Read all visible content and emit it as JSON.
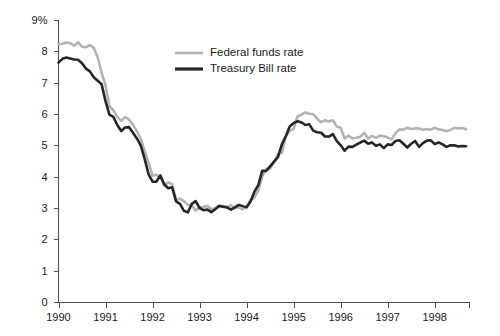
{
  "chart_data": {
    "type": "line",
    "title": "",
    "xlabel": "",
    "ylabel": "",
    "ylim": [
      0,
      9
    ],
    "xlim": [
      1990.0,
      1998.75
    ],
    "grid": false,
    "legend_position": "top-center",
    "y_ticks": [
      0,
      1,
      2,
      3,
      4,
      5,
      6,
      7,
      8,
      9
    ],
    "y_tick_labels": [
      "0",
      "1",
      "2",
      "3",
      "4",
      "5",
      "6",
      "7",
      "8",
      "9%"
    ],
    "x_ticks": [
      1990,
      1991,
      1992,
      1993,
      1994,
      1995,
      1996,
      1997,
      1998
    ],
    "x_tick_labels": [
      "1990",
      "1991",
      "1992",
      "1993",
      "1994",
      "1995",
      "1996",
      "1997",
      "1998"
    ],
    "colors": {
      "federal_funds": "#b3b3b3",
      "treasury_bill": "#262626",
      "axis": "#4d4d4d",
      "text": "#1a1a1a",
      "background": "#ffffff"
    },
    "x_start": 1990.0,
    "x_step": 0.08333,
    "series": [
      {
        "name": "Federal funds rate",
        "color_key": "federal_funds",
        "width": 2.6,
        "values": [
          8.23,
          8.24,
          8.28,
          8.26,
          8.18,
          8.29,
          8.15,
          8.13,
          8.2,
          8.11,
          7.81,
          7.31,
          6.91,
          6.25,
          6.12,
          5.91,
          5.78,
          5.9,
          5.82,
          5.66,
          5.45,
          5.21,
          4.81,
          4.43,
          4.03,
          4.06,
          3.98,
          3.73,
          3.82,
          3.76,
          3.25,
          3.3,
          3.22,
          3.1,
          3.09,
          2.92,
          3.02,
          3.03,
          3.07,
          2.96,
          3.0,
          3.04,
          3.06,
          3.03,
          3.09,
          2.99,
          3.02,
          2.96,
          3.05,
          3.25,
          3.34,
          3.56,
          4.01,
          4.25,
          4.26,
          4.47,
          4.73,
          4.76,
          5.29,
          5.45,
          5.53,
          5.92,
          5.98,
          6.05,
          6.01,
          6.0,
          5.85,
          5.74,
          5.8,
          5.76,
          5.8,
          5.6,
          5.56,
          5.22,
          5.31,
          5.22,
          5.24,
          5.27,
          5.4,
          5.22,
          5.3,
          5.24,
          5.31,
          5.29,
          5.25,
          5.19,
          5.39,
          5.51,
          5.5,
          5.56,
          5.52,
          5.54,
          5.54,
          5.5,
          5.52,
          5.5,
          5.56,
          5.51,
          5.49,
          5.45,
          5.49,
          5.56,
          5.54,
          5.55,
          5.51
        ]
      },
      {
        "name": "Treasury Bill rate",
        "color_key": "treasury_bill",
        "width": 2.6,
        "values": [
          7.64,
          7.76,
          7.8,
          7.77,
          7.74,
          7.73,
          7.62,
          7.45,
          7.36,
          7.17,
          7.06,
          6.95,
          6.41,
          5.98,
          5.91,
          5.65,
          5.46,
          5.57,
          5.58,
          5.4,
          5.22,
          4.99,
          4.56,
          4.07,
          3.84,
          3.84,
          4.04,
          3.75,
          3.63,
          3.66,
          3.21,
          3.13,
          2.91,
          2.86,
          3.13,
          3.22,
          3.0,
          2.93,
          2.95,
          2.87,
          2.96,
          3.07,
          3.04,
          3.02,
          2.95,
          3.02,
          3.1,
          3.06,
          3.02,
          3.21,
          3.52,
          3.74,
          4.19,
          4.18,
          4.33,
          4.48,
          4.62,
          5.03,
          5.29,
          5.6,
          5.71,
          5.77,
          5.73,
          5.65,
          5.67,
          5.47,
          5.42,
          5.4,
          5.28,
          5.28,
          5.36,
          5.14,
          5.0,
          4.83,
          4.96,
          4.95,
          5.02,
          5.09,
          5.15,
          5.05,
          5.09,
          4.99,
          5.03,
          4.91,
          5.03,
          5.01,
          5.14,
          5.16,
          5.05,
          4.93,
          5.05,
          5.14,
          4.95,
          5.07,
          5.15,
          5.16,
          5.04,
          5.09,
          5.03,
          4.95,
          5.0,
          5.0,
          4.96,
          4.98,
          4.97
        ]
      }
    ]
  },
  "legend": {
    "items": [
      {
        "label": "Federal funds rate",
        "color_key": "federal_funds"
      },
      {
        "label": "Treasury Bill rate",
        "color_key": "treasury_bill"
      }
    ]
  }
}
